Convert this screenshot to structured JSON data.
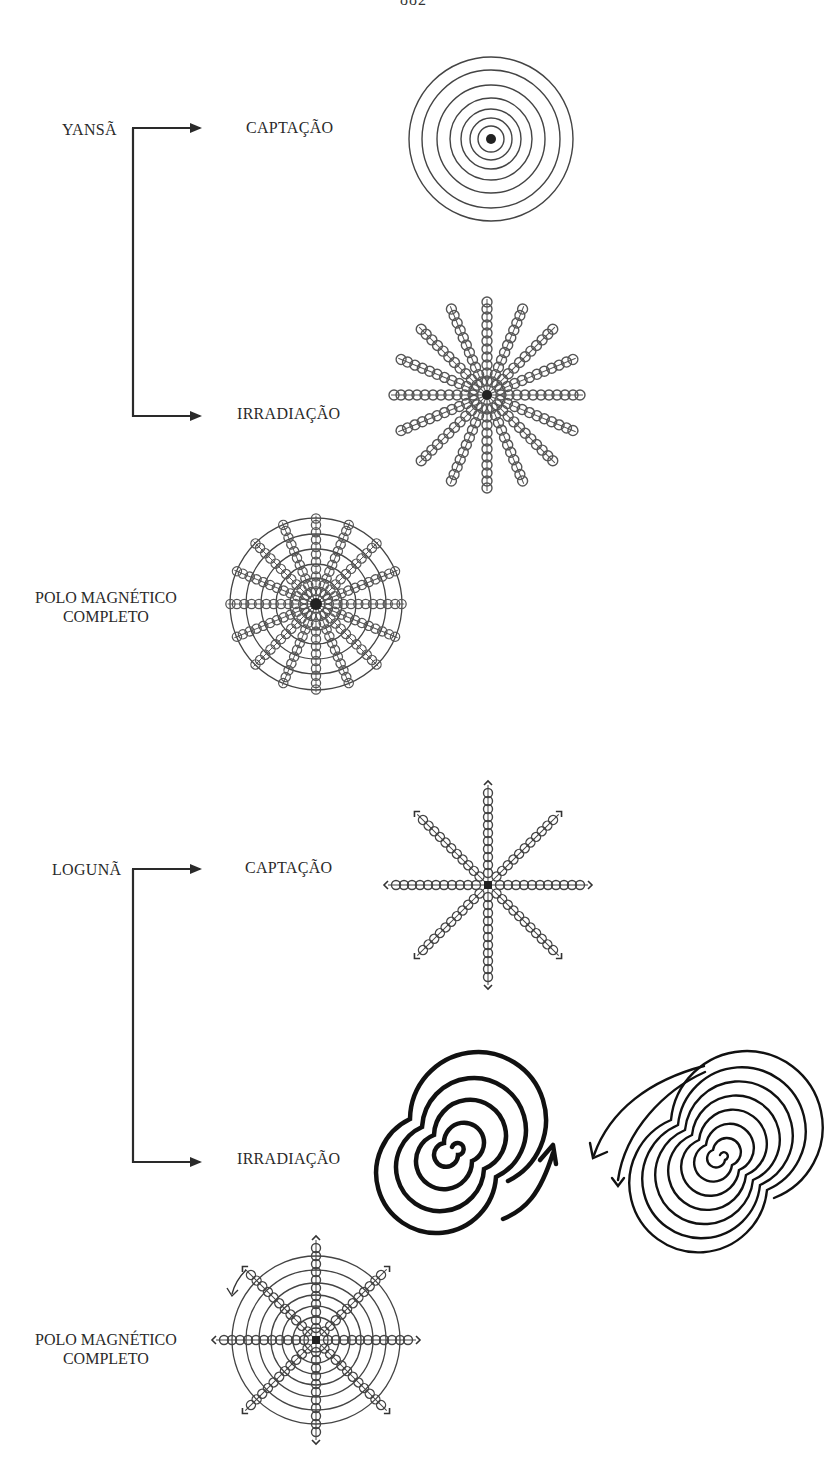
{
  "page": {
    "number": "882"
  },
  "sections": [
    {
      "entity": "YANSÃ",
      "branches": [
        {
          "label": "CAPTAÇÃO",
          "figure": "concentric-circles-with-center-dot"
        },
        {
          "label": "IRRADIAÇÃO",
          "figure": "16-spiral-coil-rays"
        }
      ],
      "complete": {
        "line1": "POLO MAGNÉTICO",
        "line2": "COMPLETO",
        "figure": "concentric-circles-with-16-coil-rays"
      }
    },
    {
      "entity": "LOGUNÃ",
      "branches": [
        {
          "label": "CAPTAÇÃO",
          "figure": "8-coil-rays-with-arrowheads"
        },
        {
          "label": "IRRADIAÇÃO",
          "figure": "two-spirals-with-arrows"
        }
      ],
      "complete": {
        "line1": "POLO MAGNÉTICO",
        "line2": "COMPLETO",
        "figure": "concentric-circles-with-8-coil-rays"
      }
    }
  ],
  "colors": {
    "ink": "#2a2a2a",
    "background": "#ffffff"
  }
}
